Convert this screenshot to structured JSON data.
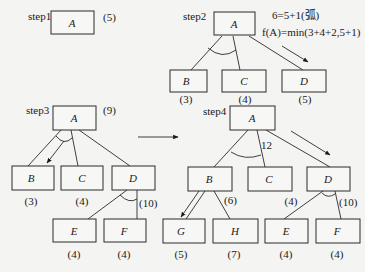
{
  "diagram": {
    "steps": [
      {
        "label": "step1",
        "nodes": [
          {
            "id": "A",
            "text": "A",
            "cost": "(5)"
          }
        ]
      },
      {
        "label": "step2",
        "annotation_line1": "6=5+1(弧)",
        "annotation_line2": "f(A)=min(3+4+2,5+1)",
        "nodes": [
          {
            "id": "A",
            "text": "A"
          },
          {
            "id": "B",
            "text": "B",
            "cost": "(3)"
          },
          {
            "id": "C",
            "text": "C",
            "cost": "(4)"
          },
          {
            "id": "D",
            "text": "D",
            "cost": "(5)"
          }
        ],
        "and_arc": [
          "B",
          "C"
        ],
        "selected": "D"
      },
      {
        "label": "step3",
        "root_cost": "(9)",
        "nodes": [
          {
            "id": "A",
            "text": "A"
          },
          {
            "id": "B",
            "text": "B",
            "cost": "(3)"
          },
          {
            "id": "C",
            "text": "C",
            "cost": "(4)"
          },
          {
            "id": "D",
            "text": "D",
            "cost": "(10)"
          },
          {
            "id": "E",
            "text": "E",
            "cost": "(4)"
          },
          {
            "id": "F",
            "text": "F",
            "cost": "(4)"
          }
        ],
        "and_arcs": [
          [
            "B",
            "C"
          ],
          [
            "E",
            "F"
          ]
        ],
        "selected": "B"
      },
      {
        "label": "step4",
        "edge_label": "12",
        "nodes": [
          {
            "id": "A",
            "text": "A"
          },
          {
            "id": "B",
            "text": "B",
            "cost": "(6)"
          },
          {
            "id": "C",
            "text": "C",
            "cost": "(4)"
          },
          {
            "id": "D",
            "text": "D",
            "cost": "(10)"
          },
          {
            "id": "G",
            "text": "G",
            "cost": "(5)"
          },
          {
            "id": "H",
            "text": "H",
            "cost": "(7)"
          },
          {
            "id": "E",
            "text": "E",
            "cost": "(4)"
          },
          {
            "id": "F",
            "text": "F",
            "cost": "(4)"
          }
        ],
        "and_arcs": [
          [
            "B",
            "C"
          ],
          [
            "E",
            "F"
          ]
        ],
        "selected": [
          "G",
          "D"
        ]
      }
    ],
    "transition_arrow": "step3 → step4"
  }
}
